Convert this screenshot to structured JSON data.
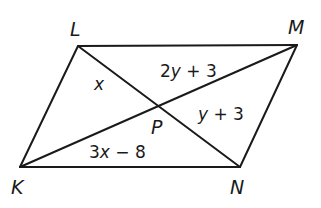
{
  "diagram": {
    "type": "parallelogram with diagonals",
    "vertices": {
      "L": {
        "label": "L",
        "x": 78,
        "y": 46
      },
      "M": {
        "label": "M",
        "x": 297,
        "y": 45
      },
      "N": {
        "label": "N",
        "x": 240,
        "y": 167
      },
      "K": {
        "label": "K",
        "x": 20,
        "y": 167
      }
    },
    "intersection": {
      "label": "P",
      "x": 159,
      "y": 106
    },
    "segment_labels": {
      "LP": {
        "text": "x",
        "var": "x",
        "rest": ""
      },
      "MP": {
        "text": "2y + 3",
        "pre": "2",
        "var": "y",
        "rest": " + 3"
      },
      "NP": {
        "text": "y + 3",
        "pre": "",
        "var": "y",
        "rest": " + 3"
      },
      "KP": {
        "text": "3x − 8",
        "pre": "3",
        "var": "x",
        "rest": " − 8"
      }
    },
    "colors": {
      "stroke": "#1a1a1a",
      "background": "#ffffff"
    }
  }
}
